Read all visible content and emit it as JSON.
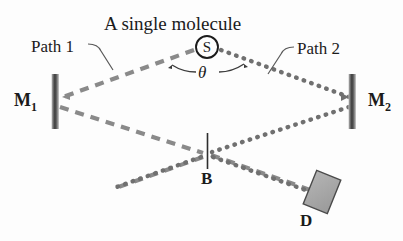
{
  "figure": {
    "title": "A single molecule",
    "labels": {
      "path1": "Path 1",
      "path2": "Path 2",
      "mirror_left": "M",
      "mirror_left_sub": "1",
      "mirror_right": "M",
      "mirror_right_sub": "2",
      "angle": "θ",
      "beamsplitter": "B",
      "detector": "D",
      "source": "S"
    },
    "colors": {
      "background": "#fdfdfd",
      "text": "#1b1b1b",
      "beam_gray": "#8a8a8a",
      "beam_dotted": "#707070",
      "mirror_dark": "#3a3a3a",
      "mirror_light": "#b8b8b8",
      "detector_fill": "#a8a8a8",
      "detector_stroke": "#4a4a4a",
      "leader_line": "#5a5a5a"
    },
    "geometry": {
      "source": {
        "x": 207,
        "y": 47,
        "r": 11
      },
      "mirror_left": {
        "x": 55,
        "y_top": 74,
        "y_bottom": 129,
        "width": 7
      },
      "mirror_right": {
        "x": 352,
        "y_top": 74,
        "y_bottom": 129,
        "width": 7
      },
      "beamsplitter": {
        "x": 207,
        "y_top": 133,
        "y_bottom": 169
      },
      "detector": {
        "x": 322,
        "y": 192,
        "width": 26,
        "height": 36,
        "rotation": 22
      }
    },
    "paths": {
      "path1_style": "dashed",
      "path2_style": "dotted"
    }
  }
}
